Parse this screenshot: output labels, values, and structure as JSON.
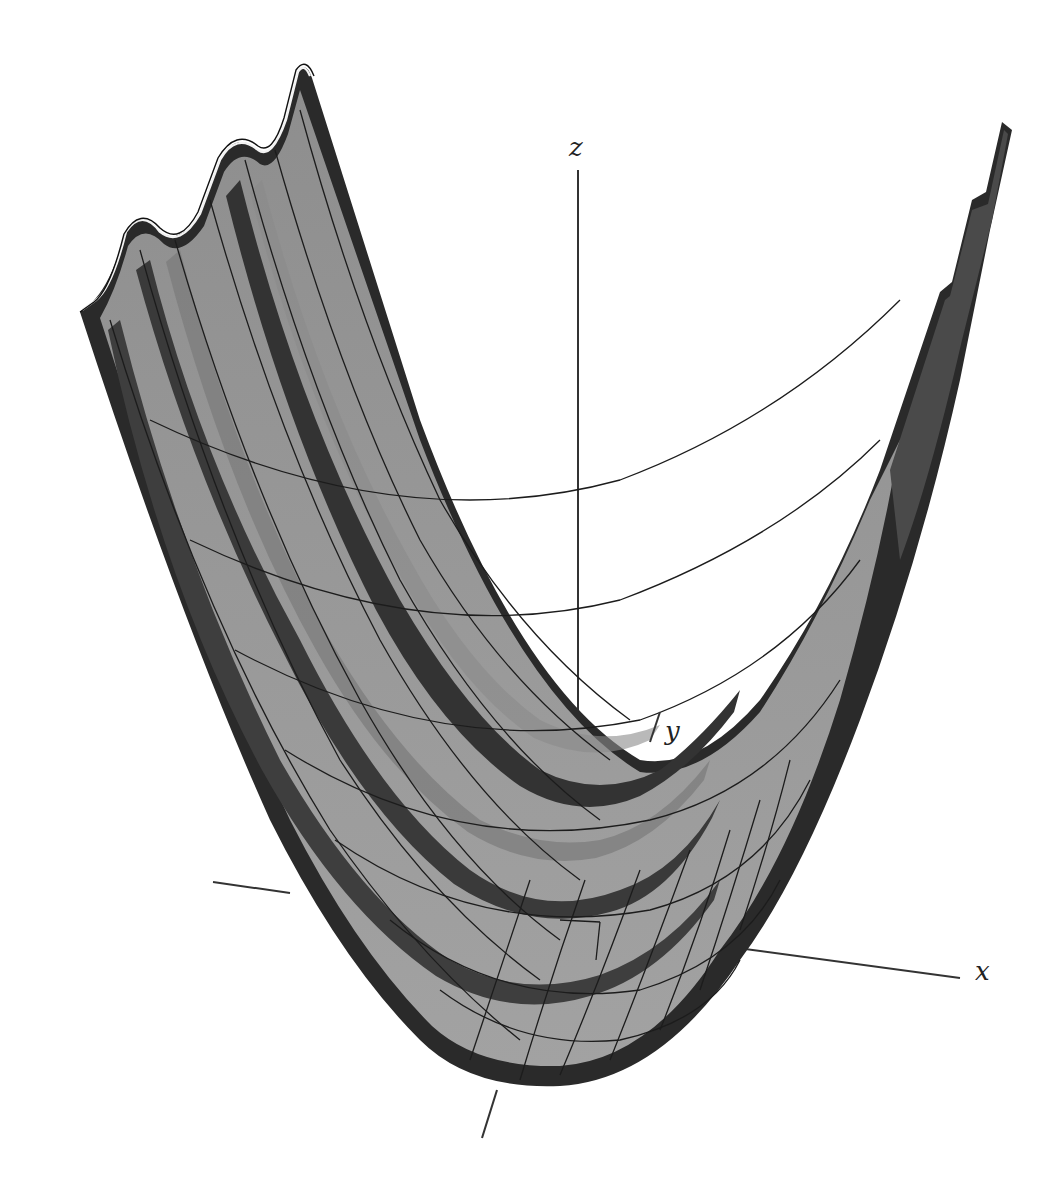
{
  "figure": {
    "type": "3d-surface-plot",
    "background": "#ffffff",
    "surface_fill_light": "#9a9a9a",
    "surface_fill_mid": "#6e6e6e",
    "surface_fill_dark": "#2e2e2e",
    "edge_color": "#1a1a1a",
    "mesh_color": "#1c1c1c",
    "axis_color": "#333333"
  },
  "axes": {
    "x": {
      "label": "x",
      "label_pos": [
        978,
        962
      ]
    },
    "y": {
      "label": "y",
      "label_pos": [
        668,
        724
      ]
    },
    "z": {
      "label": "z",
      "label_pos": [
        569,
        137
      ]
    }
  },
  "surface": {
    "ridge_count": 3,
    "left_rim_peaks": [
      [
        126,
        228
      ],
      [
        238,
        140
      ],
      [
        298,
        68
      ]
    ],
    "right_rim_peaks": [
      [
        938,
        288
      ],
      [
        972,
        196
      ],
      [
        1005,
        118
      ]
    ]
  }
}
